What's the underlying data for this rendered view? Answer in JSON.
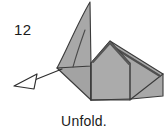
{
  "figure": {
    "type": "origami-instruction-diagram",
    "step_number": "12",
    "caption": "Unfold.",
    "colors": {
      "background": "#ffffff",
      "paper_fill": "#a8a8a8",
      "paper_fill_light": "#b4b4b4",
      "paper_fill_dark": "#9a9a9a",
      "outline": "#3a3a3a",
      "ridge_shadow": "#4a4a4a",
      "text": "#1a1a1a",
      "arrow_stroke": "#2e2e2e",
      "arrow_fill": "#ffffff"
    },
    "arrow": {
      "name": "unfold-arrow",
      "direction": "left-down",
      "head_style": "hollow-triangle",
      "tail_start_x": 62,
      "tail_start_y": 69,
      "head_tip_x": 15,
      "head_tip_y": 86
    },
    "shape_parts": [
      {
        "name": "left-flap",
        "label": "upper left pointed flap"
      },
      {
        "name": "left-lower-wing",
        "label": "lower left wing"
      },
      {
        "name": "center-body",
        "label": "central body panel"
      },
      {
        "name": "right-ridge-panel",
        "label": "right ridged panel"
      },
      {
        "name": "right-tail",
        "label": "right tail point"
      },
      {
        "name": "fold-crease-curve",
        "label": "curved crease line in left flap"
      }
    ]
  }
}
